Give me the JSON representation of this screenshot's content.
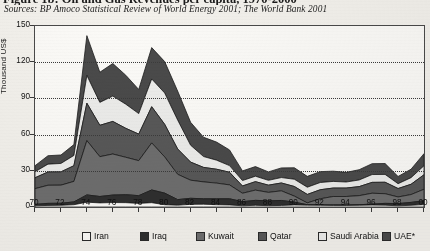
{
  "figure": {
    "title": "Figure 1b: Oil and Gas Revenues per capita, 1970-2000",
    "sources": "Sources: BP Amoco Statistical Review of World Energy 2001; The World Bank 2001"
  },
  "axes": {
    "ylabel": "Thousand US$",
    "yticks": [
      "0",
      "30",
      "60",
      "90",
      "120",
      "150"
    ],
    "ylim": [
      0,
      150
    ],
    "xticks": [
      "70",
      "72",
      "74",
      "76",
      "78",
      "80",
      "82",
      "84",
      "86",
      "88",
      "90",
      "92",
      "94",
      "96",
      "98",
      "00"
    ],
    "grid": "horizontal dotted at 30, 60, 90, 120"
  },
  "legend": {
    "position": "bottom",
    "items": [
      {
        "label": "Iran",
        "color": "#fbfaf7"
      },
      {
        "label": "Iraq",
        "color": "#2f2f2f"
      },
      {
        "label": "Kuwait",
        "color": "#6e6e6e"
      },
      {
        "label": "Qatar",
        "color": "#585858"
      },
      {
        "label": "Saudi Arabia",
        "color": "#ececea"
      },
      {
        "label": "UAE*",
        "color": "#4a4a4a"
      }
    ]
  },
  "chart_data": {
    "type": "area",
    "title": "Figure 1b: Oil and Gas Revenues per capita, 1970-2000",
    "xlabel": "",
    "ylabel": "Thousand US$",
    "ylim": [
      0,
      150
    ],
    "grid": true,
    "stacked": true,
    "x": [
      "70",
      "71",
      "72",
      "73",
      "74",
      "75",
      "76",
      "77",
      "78",
      "79",
      "80",
      "81",
      "82",
      "83",
      "84",
      "85",
      "86",
      "87",
      "88",
      "89",
      "90",
      "91",
      "92",
      "93",
      "94",
      "95",
      "96",
      "97",
      "98",
      "99",
      "00"
    ],
    "series": [
      {
        "name": "Iran",
        "color": "#fbfaf7",
        "values": [
          1.0,
          1.3,
          1.4,
          1.9,
          4.0,
          3.4,
          3.7,
          3.6,
          3.0,
          3.6,
          1.9,
          1.5,
          2.2,
          2.3,
          1.9,
          1.7,
          1.0,
          1.4,
          1.1,
          1.3,
          1.7,
          1.5,
          1.4,
          1.3,
          1.3,
          1.4,
          1.6,
          1.5,
          1.0,
          1.4,
          2.0
        ]
      },
      {
        "name": "Iraq",
        "color": "#2f2f2f",
        "values": [
          1.2,
          1.7,
          1.7,
          2.3,
          6.0,
          5.3,
          6.2,
          6.6,
          6.4,
          10.5,
          9.6,
          4.6,
          5.0,
          4.5,
          4.9,
          5.1,
          3.4,
          4.1,
          4.0,
          4.1,
          2.3,
          0.4,
          0.4,
          0.4,
          0.4,
          0.5,
          0.8,
          1.5,
          1.8,
          2.4,
          3.2
        ]
      },
      {
        "name": "Kuwait",
        "color": "#6e6e6e",
        "values": [
          13.0,
          15.0,
          15.0,
          17.0,
          45.0,
          33.0,
          34.0,
          31.0,
          29.0,
          39.0,
          30.0,
          21.0,
          15.0,
          14.0,
          13.0,
          11.5,
          7.0,
          8.5,
          7.0,
          8.0,
          5.0,
          1.5,
          5.0,
          7.0,
          7.0,
          7.5,
          9.0,
          8.0,
          5.5,
          6.5,
          9.5
        ]
      },
      {
        "name": "Qatar",
        "color": "#585858",
        "values": [
          9.0,
          11.0,
          11.0,
          13.0,
          31.0,
          26.0,
          27.0,
          24.0,
          22.0,
          30.0,
          27.0,
          21.0,
          15.0,
          12.0,
          11.5,
          10.5,
          6.0,
          7.0,
          6.0,
          6.5,
          8.0,
          7.0,
          7.5,
          7.0,
          7.0,
          7.5,
          9.0,
          9.5,
          7.0,
          8.5,
          12.0
        ]
      },
      {
        "name": "Saudi Arabia",
        "color": "#ececea",
        "values": [
          5.0,
          6.5,
          7.0,
          8.5,
          23.0,
          19.0,
          21.0,
          20.0,
          17.0,
          23.0,
          26.0,
          24.0,
          14.0,
          9.0,
          7.5,
          5.5,
          4.5,
          4.5,
          4.0,
          4.5,
          6.0,
          6.0,
          6.0,
          5.5,
          5.0,
          5.5,
          6.5,
          6.5,
          4.0,
          5.5,
          7.5
        ]
      },
      {
        "name": "UAE*",
        "color": "#4a4a4a",
        "values": [
          5.0,
          7.0,
          7.0,
          9.0,
          33.0,
          25.0,
          27.0,
          24.0,
          20.0,
          26.0,
          26.0,
          24.0,
          19.0,
          16.0,
          15.0,
          13.0,
          8.0,
          8.0,
          7.0,
          8.0,
          9.5,
          9.0,
          9.0,
          8.5,
          8.0,
          8.5,
          9.0,
          9.0,
          6.0,
          7.0,
          10.0
        ]
      }
    ],
    "totals": [
      34.2,
      42.5,
      43.1,
      51.7,
      142.0,
      111.7,
      118.9,
      109.2,
      97.4,
      132.1,
      120.5,
      96.1,
      70.2,
      57.3,
      53.8,
      47.3,
      29.9,
      33.5,
      29.1,
      32.4,
      32.5,
      25.4,
      29.3,
      29.7,
      28.7,
      30.9,
      35.9,
      36.0,
      25.3,
      31.3,
      44.2
    ],
    "annotations": [
      {
        "text": "peak 1974 ≈ 142",
        "x": "74"
      },
      {
        "text": "secondary peak 1979-80 ≈ 120-132",
        "x": "79"
      },
      {
        "text": "trough 1998 ≈ 25",
        "x": "98"
      }
    ]
  }
}
